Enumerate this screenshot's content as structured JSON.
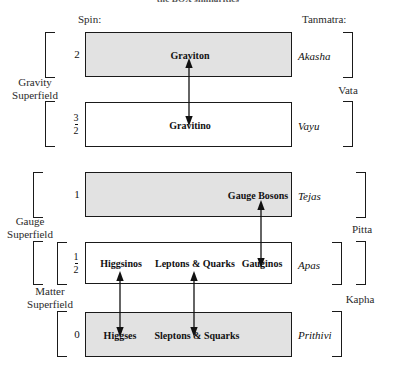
{
  "title": "the BOX similarities",
  "headers": {
    "spin": "Spin:",
    "tanmatra": "Tanmatra:"
  },
  "superfields": [
    {
      "name": "gravity-superfield",
      "line1": "Gravity",
      "line2": "Superfield"
    },
    {
      "name": "gauge-superfield",
      "line1": "Gauge",
      "line2": "Superfield"
    },
    {
      "name": "matter-superfield",
      "line1": "Matter",
      "line2": "Superfield"
    }
  ],
  "doshas": [
    {
      "name": "vata",
      "label": "Vata"
    },
    {
      "name": "pitta",
      "label": "Pitta"
    },
    {
      "name": "kapha",
      "label": "Kapha"
    }
  ],
  "rows": [
    {
      "id": "graviton-row",
      "spin": {
        "type": "integer",
        "value": "2"
      },
      "tanmatra": "Akasha",
      "shaded": true,
      "particles": [
        {
          "name": "graviton",
          "label": "Graviton"
        }
      ]
    },
    {
      "id": "gravitino-row",
      "spin": {
        "type": "fraction",
        "num": "3",
        "den": "2"
      },
      "tanmatra": "Vayu",
      "shaded": false,
      "particles": [
        {
          "name": "gravitino",
          "label": "Gravitino"
        }
      ]
    },
    {
      "id": "gauge-bosons-row",
      "spin": {
        "type": "integer",
        "value": "1"
      },
      "tanmatra": "Tejas",
      "shaded": true,
      "particles": [
        {
          "name": "gauge-bosons",
          "label": "Gauge Bosons"
        }
      ]
    },
    {
      "id": "fermions-row",
      "spin": {
        "type": "fraction",
        "num": "1",
        "den": "2"
      },
      "tanmatra": "Apas",
      "shaded": false,
      "particles": [
        {
          "name": "higgsinos",
          "label": "Higgsinos"
        },
        {
          "name": "leptons-and-quarks",
          "label": "Leptons & Quarks"
        },
        {
          "name": "gauginos",
          "label": "Gauginos"
        }
      ]
    },
    {
      "id": "scalars-row",
      "spin": {
        "type": "integer",
        "value": "0"
      },
      "tanmatra": "Prithivi",
      "shaded": true,
      "particles": [
        {
          "name": "higgses",
          "label": "Higgses"
        },
        {
          "name": "sleptons-and-squarks",
          "label": "Sleptons & Squarks"
        }
      ]
    }
  ],
  "colors": {
    "shaded_box": "#e2e2e2",
    "stroke": "#1a1a1a",
    "text": "#111111",
    "background": "#ffffff"
  }
}
